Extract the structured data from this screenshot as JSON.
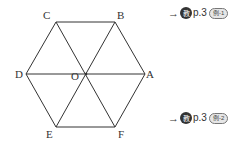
{
  "figure": {
    "vertices": {
      "A": {
        "label": "A",
        "x": 145,
        "y": 74
      },
      "B": {
        "label": "B",
        "x": 115,
        "y": 22
      },
      "C": {
        "label": "C",
        "x": 56,
        "y": 22
      },
      "D": {
        "label": "D",
        "x": 26,
        "y": 74
      },
      "E": {
        "label": "E",
        "x": 56,
        "y": 127
      },
      "F": {
        "label": "F",
        "x": 115,
        "y": 127
      },
      "O": {
        "label": "O",
        "x": 86,
        "y": 74
      }
    },
    "line_color": "#333333"
  },
  "references": [
    {
      "arrow": "→",
      "badge": "教",
      "page": "p.3",
      "tag": "例-1"
    },
    {
      "arrow": "→",
      "badge": "教",
      "page": "p.3",
      "tag": "例-2"
    }
  ]
}
